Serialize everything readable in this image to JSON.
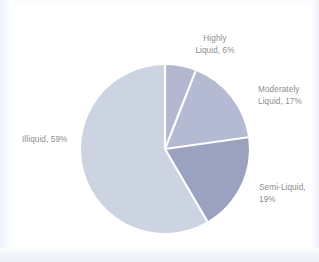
{
  "chart_data": {
    "type": "pie",
    "title": "",
    "subtitle": "",
    "xlabel": "",
    "ylabel": "",
    "legend_position": "none",
    "grid": false,
    "labels_placement": "outside-callout",
    "categories": [
      "Highly Liquid",
      "Moderately Liquid",
      "Semi-Liquid",
      "Illiquid"
    ],
    "values": [
      6,
      17,
      19,
      59
    ],
    "value_unit": "%",
    "start_angle_deg": 0,
    "direction": "clockwise",
    "slice_colors": [
      "#b2b8d0",
      "#b4bad1",
      "#9aa2c0",
      "#ccd4e1"
    ],
    "slices": [
      {
        "label": "Highly Liquid",
        "value": 6,
        "display": "Highly\nLiquid, 6%",
        "color": "#b2b8d0"
      },
      {
        "label": "Moderately Liquid",
        "value": 17,
        "display": "Moderately\nLiquid, 17%",
        "color": "#b4bad1"
      },
      {
        "label": "Semi-Liquid",
        "value": 19,
        "display": "Semi-Liquid,\n19%",
        "color": "#9aa2c0"
      },
      {
        "label": "Illiquid",
        "value": 59,
        "display": "Illiquid, 59%",
        "color": "#ccd4e1"
      }
    ],
    "annotations": []
  },
  "style": {
    "background": "#ffffff",
    "separator_color": "#ffffff",
    "label_text_color": "#8d8d8f"
  }
}
